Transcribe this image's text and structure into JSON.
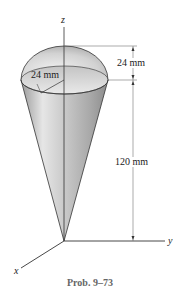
{
  "figure": {
    "caption": "Prob. 9–73",
    "labels": {
      "hemisphere_height": "24 mm",
      "radius": "24 mm",
      "cone_height": "120 mm"
    },
    "axes": {
      "z": "z",
      "y": "y",
      "x": "x"
    },
    "colors": {
      "surface_light": "#e4e4e4",
      "surface_mid": "#bdbdbd",
      "surface_dark": "#8a8a8a",
      "line": "#333333",
      "caption": "#666666"
    }
  }
}
